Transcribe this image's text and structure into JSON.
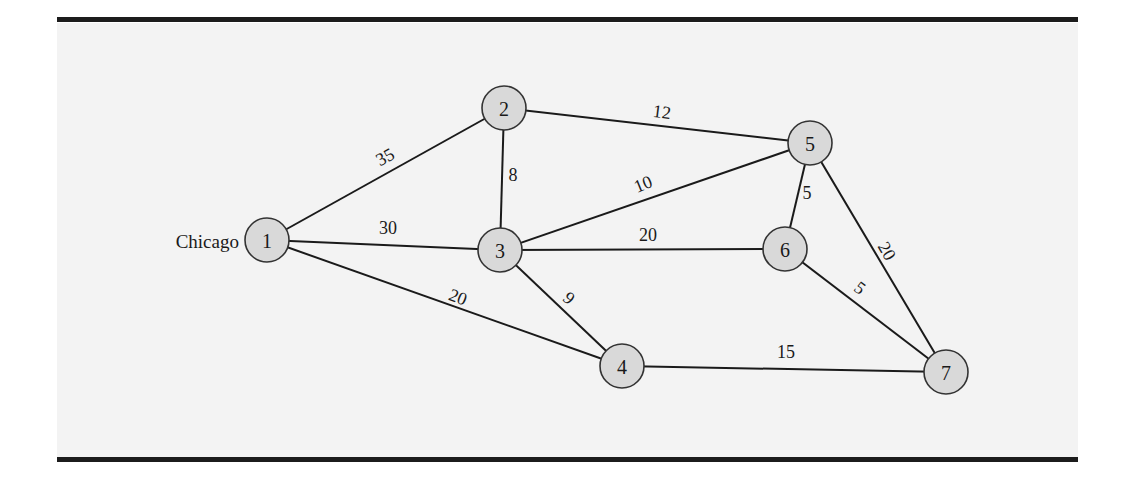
{
  "diagram": {
    "type": "network-graph",
    "origin_label": "Chicago",
    "origin_node": "1",
    "nodes": [
      {
        "id": "1",
        "label": "1",
        "x": 267,
        "y": 240
      },
      {
        "id": "2",
        "label": "2",
        "x": 504,
        "y": 108
      },
      {
        "id": "3",
        "label": "3",
        "x": 500,
        "y": 250
      },
      {
        "id": "4",
        "label": "4",
        "x": 622,
        "y": 366
      },
      {
        "id": "5",
        "label": "5",
        "x": 810,
        "y": 143
      },
      {
        "id": "6",
        "label": "6",
        "x": 785,
        "y": 249
      },
      {
        "id": "7",
        "label": "7",
        "x": 946,
        "y": 372
      }
    ],
    "edges": [
      {
        "from": "1",
        "to": "2",
        "weight": "35",
        "lx": 385,
        "ly": 157,
        "angle": -29
      },
      {
        "from": "1",
        "to": "3",
        "weight": "30",
        "lx": 388,
        "ly": 228,
        "angle": 0
      },
      {
        "from": "1",
        "to": "4",
        "weight": "20",
        "lx": 458,
        "ly": 297,
        "angle": 21
      },
      {
        "from": "2",
        "to": "3",
        "weight": "8",
        "lx": 513,
        "ly": 175,
        "angle": 0
      },
      {
        "from": "2",
        "to": "5",
        "weight": "12",
        "lx": 662,
        "ly": 112,
        "angle": 7
      },
      {
        "from": "3",
        "to": "5",
        "weight": "10",
        "lx": 643,
        "ly": 184,
        "angle": -22
      },
      {
        "from": "3",
        "to": "6",
        "weight": "20",
        "lx": 648,
        "ly": 235,
        "angle": 0
      },
      {
        "from": "3",
        "to": "4",
        "weight": "9",
        "lx": 569,
        "ly": 298,
        "angle": 40
      },
      {
        "from": "5",
        "to": "6",
        "weight": "5",
        "lx": 807,
        "ly": 193,
        "angle": 0
      },
      {
        "from": "5",
        "to": "7",
        "weight": "20",
        "lx": 887,
        "ly": 251,
        "angle": 60
      },
      {
        "from": "6",
        "to": "7",
        "weight": "5",
        "lx": 860,
        "ly": 288,
        "angle": 37
      },
      {
        "from": "4",
        "to": "7",
        "weight": "15",
        "lx": 786,
        "ly": 352,
        "angle": 0
      }
    ]
  }
}
